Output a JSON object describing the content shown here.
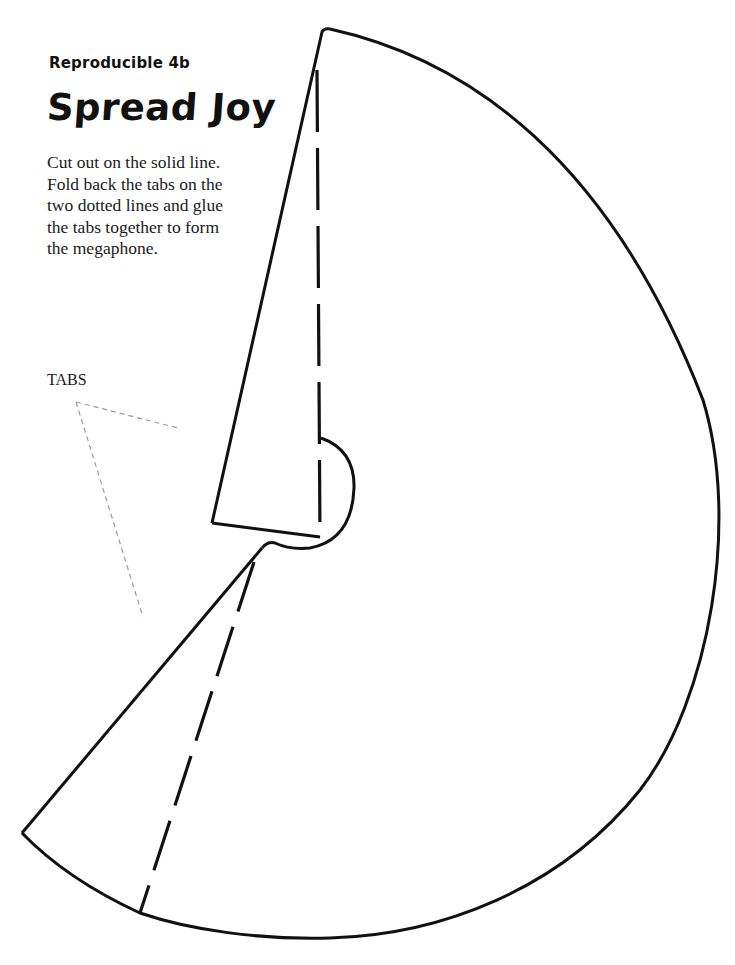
{
  "header": {
    "subtitle": "Reproducible 4b",
    "title": "Spread Joy"
  },
  "instructions": {
    "lines": [
      "Cut out on the solid line.",
      "Fold back the tabs on the",
      "two dotted lines and glue",
      "the tabs together to form",
      "the megaphone."
    ]
  },
  "callout": {
    "label": "TABS"
  },
  "colors": {
    "outline": "#111111",
    "leader_lines": "#9a9a9a",
    "background": "#ffffff"
  }
}
